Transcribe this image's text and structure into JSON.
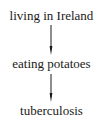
{
  "diagram": {
    "type": "causal-chain",
    "nodes": [
      {
        "id": "n0",
        "label": "living in Ireland"
      },
      {
        "id": "n1",
        "label": "eating potatoes"
      },
      {
        "id": "n2",
        "label": "tuberculosis"
      }
    ],
    "edges": [
      {
        "from": "n0",
        "to": "n1",
        "style": "arrow"
      },
      {
        "from": "n1",
        "to": "n2",
        "style": "arrow"
      }
    ],
    "colors": {
      "text": "#1a1a1a",
      "arrow": "#1a1a1a",
      "background": "#ffffff"
    }
  }
}
